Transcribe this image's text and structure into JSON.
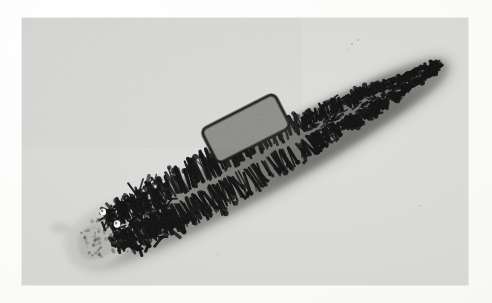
{
  "page": {
    "kind": "photographic-plate",
    "background_color": "#fcfcfb",
    "plate_color": "#d9d9d7",
    "plate_bounds": {
      "x": 22,
      "y": 18,
      "width": 446,
      "height": 267
    }
  },
  "plate": {
    "subject": "stained flatworm (trematode / fluke) whole mount",
    "caption": "",
    "label": "",
    "tone_light": "#dedede",
    "tone_mid": "#d8d8d6",
    "tone_dark": "#1a1a1a"
  },
  "specimen": {
    "name": "flatworm-specimen",
    "orientation": "diagonal, anterior upper-right, posterior lower-left",
    "anterior_tip": {
      "x": 423,
      "y": 44
    },
    "posterior_tip": {
      "x": 56,
      "y": 232
    },
    "body_color_halo": "#9b9b97",
    "cecum_color": "#141414",
    "tail_color": "#c4c4c0",
    "parts": [
      {
        "part": "anterior-end",
        "note": "tapered rounded point upper right"
      },
      {
        "part": "intestinal-ceca",
        "note": "dense black dendritic branches along both sides of midline"
      },
      {
        "part": "uterus-region",
        "note": "pale elongated rectangular structure mid-body"
      },
      {
        "part": "posterior-tail",
        "note": "pale translucent triangular tail, lower left"
      },
      {
        "part": "vacuole-spot-1",
        "x": 81,
        "y": 194
      },
      {
        "part": "vacuole-spot-2",
        "x": 95,
        "y": 205
      }
    ]
  },
  "uterus": {
    "name": "uterus-structure",
    "x": 183,
    "y": 90,
    "width": 80,
    "height": 42,
    "fill": "#8a8a86",
    "outline": "#1d1d1d"
  }
}
